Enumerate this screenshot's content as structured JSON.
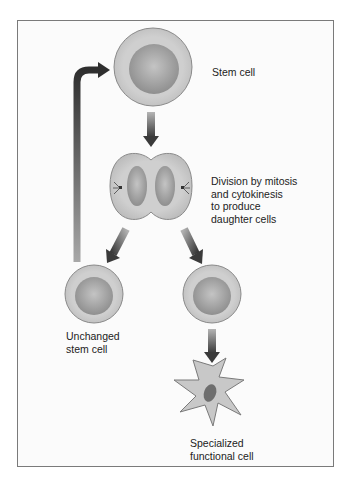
{
  "diagram": {
    "labels": {
      "stem_cell": "Stem cell",
      "division": [
        "Division by mitosis",
        "and cytokinesis",
        "to produce",
        "daughter cells"
      ],
      "unchanged": [
        "Unchanged",
        "stem cell"
      ],
      "specialized": [
        "Specialized",
        "functional cell"
      ]
    },
    "colors": {
      "frame_border": "#7a7a7a",
      "cell_outer": "#c9c9c9",
      "cell_nucleus": "#9d9d9d",
      "arrow_dark": "#3a3a3a",
      "arrow_light": "#b0b0b0",
      "specialized_nucleus": "#6e6e6e"
    }
  }
}
